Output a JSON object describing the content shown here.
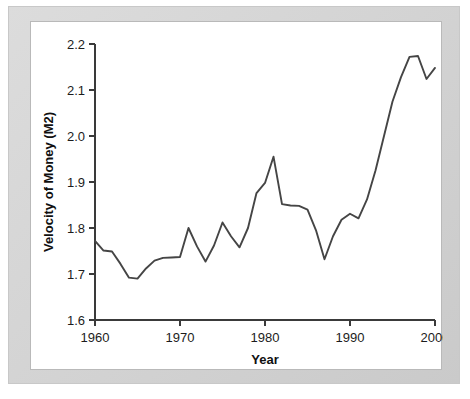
{
  "figure": {
    "frame_color": "#d6d6d6",
    "panel_color": "#ffffff",
    "line_color": "#454545"
  },
  "chart_data": {
    "type": "line",
    "title": "",
    "xlabel": "Year",
    "ylabel": "Velocity of Money (M2)",
    "xlim": [
      1960,
      2000
    ],
    "ylim": [
      1.6,
      2.2
    ],
    "xticks": [
      1960,
      1970,
      1980,
      1990,
      2000
    ],
    "xtick_labels": [
      "1960",
      "1970",
      "1980",
      "1990",
      "2000"
    ],
    "yticks": [
      1.6,
      1.7,
      1.8,
      1.9,
      2.0,
      2.1,
      2.2
    ],
    "ytick_labels": [
      "1.6",
      "1.7",
      "1.8",
      "1.9",
      "2.0",
      "2.1",
      "2.2"
    ],
    "grid": false,
    "legend": false,
    "x": [
      1960,
      1961,
      1962,
      1963,
      1964,
      1965,
      1966,
      1967,
      1968,
      1969,
      1970,
      1971,
      1972,
      1973,
      1974,
      1975,
      1976,
      1977,
      1978,
      1979,
      1980,
      1981,
      1982,
      1983,
      1984,
      1985,
      1986,
      1987,
      1988,
      1989,
      1990,
      1991,
      1992,
      1993,
      1994,
      1995,
      1996,
      1997,
      1998,
      1999,
      2000
    ],
    "values": [
      1.772,
      1.751,
      1.749,
      1.722,
      1.692,
      1.69,
      1.712,
      1.729,
      1.735,
      1.736,
      1.737,
      1.8,
      1.76,
      1.727,
      1.762,
      1.812,
      1.782,
      1.758,
      1.8,
      1.876,
      1.898,
      1.955,
      1.852,
      1.849,
      1.848,
      1.84,
      1.795,
      1.732,
      1.782,
      1.818,
      1.831,
      1.821,
      1.862,
      1.925,
      2.0,
      2.075,
      2.128,
      2.172,
      2.174,
      2.124,
      2.148
    ]
  }
}
